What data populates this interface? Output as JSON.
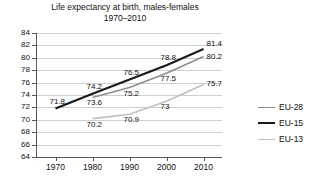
{
  "chart_data": {
    "type": "line",
    "title": "Life expectancy at birth, males-females",
    "subtitle": "1970–2010",
    "xlabel": "",
    "ylabel": "",
    "x": [
      1970,
      1980,
      1990,
      2000,
      2010
    ],
    "xticklabels": [
      "1970",
      "1980",
      "1990",
      "2000",
      "2010"
    ],
    "yticklabels": [
      "84",
      "82",
      "80",
      "78",
      "76",
      "74",
      "72",
      "70",
      "68",
      "66",
      "64"
    ],
    "ylim": [
      64,
      84
    ],
    "xlim": [
      1965,
      2015
    ],
    "ytick_step": 2,
    "grid": "horizontal",
    "legend_position": "right",
    "series": [
      {
        "name": "EU-28",
        "color": "#8c8c8c",
        "values": [
          null,
          73.6,
          75.2,
          77.5,
          80.2
        ],
        "labels": [
          "",
          "73.6",
          "75.2",
          "77.5",
          "80.2"
        ]
      },
      {
        "name": "EU-15",
        "color": "#1a1a1a",
        "values": [
          71.8,
          74.2,
          76.5,
          78.8,
          81.4
        ],
        "labels": [
          "71.8",
          "74.2",
          "76.5",
          "78.8",
          "81.4"
        ]
      },
      {
        "name": "EU-13",
        "color": "#bfbfbf",
        "values": [
          null,
          70.2,
          70.9,
          73.0,
          75.7
        ],
        "labels": [
          "",
          "70.2",
          "70.9",
          "73",
          "75.7"
        ]
      }
    ]
  },
  "legend": {
    "items": [
      {
        "label": "EU-28",
        "color": "#8c8c8c",
        "width": "1.6px"
      },
      {
        "label": "EU-15",
        "color": "#1a1a1a",
        "width": "2.2px"
      },
      {
        "label": "EU-13",
        "color": "#bfbfbf",
        "width": "1.6px"
      }
    ]
  }
}
